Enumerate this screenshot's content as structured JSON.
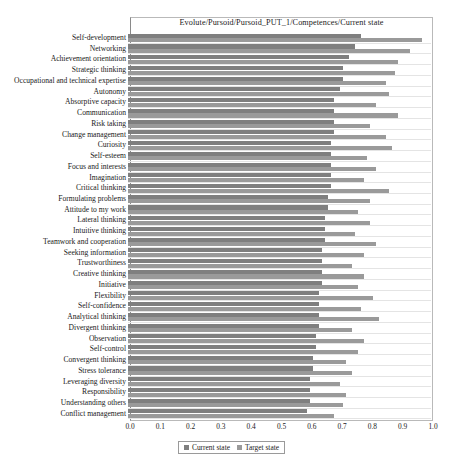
{
  "chart_data": {
    "type": "bar",
    "orientation": "horizontal",
    "title": "Evolute/Pursoid/Pursoid_PUT_1/Competences/Current state",
    "xlabel": "",
    "ylabel": "",
    "xlim": [
      0.0,
      1.0
    ],
    "grid": true,
    "legend_position": "bottom",
    "xticks": [
      "0.0",
      "0.1",
      "0.2",
      "0.3",
      "0.4",
      "0.5",
      "0.6",
      "0.7",
      "0.8",
      "0.9",
      "1.0"
    ],
    "categories": [
      "Self-development",
      "Networking",
      "Achievement orientation",
      "Strategic thinking",
      "Occupational and technical expertise",
      "Autonomy",
      "Absorptive capacity",
      "Communication",
      "Risk taking",
      "Change management",
      "Curiosity",
      "Self-esteem",
      "Focus and interests",
      "Imagination",
      "Critical thinking",
      "Formulating problems",
      "Attitude to my work",
      "Lateral thinking",
      "Intuitive thinking",
      "Teamwork and cooperation",
      "Seeking information",
      "Trustworthiness",
      "Creative thinking",
      "Initiative",
      "Flexibility",
      "Self-confidence",
      "Analytical thinking",
      "Divergent thinking",
      "Observation",
      "Self-control",
      "Convergent thinking",
      "Stress tolerance",
      "Leveraging diversity",
      "Responsibility",
      "Understanding others",
      "Conflict management"
    ],
    "series": [
      {
        "name": "Current state",
        "color": "#7f7f7f",
        "values": [
          0.77,
          0.75,
          0.73,
          0.71,
          0.71,
          0.7,
          0.68,
          0.68,
          0.68,
          0.68,
          0.67,
          0.67,
          0.67,
          0.67,
          0.67,
          0.66,
          0.66,
          0.65,
          0.65,
          0.65,
          0.64,
          0.64,
          0.64,
          0.64,
          0.63,
          0.63,
          0.63,
          0.63,
          0.62,
          0.62,
          0.61,
          0.61,
          0.6,
          0.6,
          0.6,
          0.59
        ]
      },
      {
        "name": "Target state",
        "color": "#9a9a9a",
        "values": [
          0.97,
          0.93,
          0.89,
          0.88,
          0.85,
          0.86,
          0.82,
          0.89,
          0.8,
          0.85,
          0.87,
          0.79,
          0.82,
          0.78,
          0.86,
          0.8,
          0.76,
          0.8,
          0.75,
          0.82,
          0.78,
          0.74,
          0.78,
          0.76,
          0.81,
          0.77,
          0.83,
          0.74,
          0.78,
          0.76,
          0.72,
          0.74,
          0.7,
          0.72,
          0.71,
          0.68
        ]
      }
    ]
  },
  "legend": {
    "items": [
      {
        "label": "Current state"
      },
      {
        "label": "Target state"
      }
    ]
  }
}
